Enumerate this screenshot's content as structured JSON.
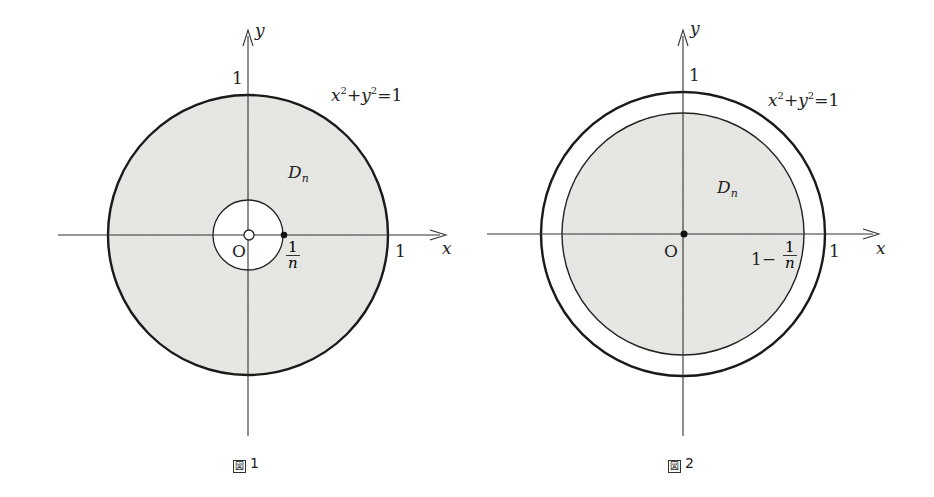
{
  "figures": [
    {
      "caption": "図1",
      "caption_symbol": "図",
      "caption_number": "1",
      "axis_x_label": "x",
      "axis_y_label": "y",
      "origin_label": "O",
      "tick_x": "1",
      "tick_y": "1",
      "circle_equation": {
        "x": "x",
        "x_exp": "2",
        "plus": "+",
        "y": "y",
        "y_exp": "2",
        "eq": "=1"
      },
      "region_label": {
        "main": "D",
        "sub": "n"
      },
      "inner_radius_label": {
        "num": "1",
        "den": "n"
      },
      "description": "Annulus 1/n ≤ r ≤ 1 shaded; origin is an open (excluded) point"
    },
    {
      "caption": "図2",
      "caption_symbol": "図",
      "caption_number": "2",
      "axis_x_label": "x",
      "axis_y_label": "y",
      "origin_label": "O",
      "tick_x": "1",
      "tick_y": "1",
      "circle_equation": {
        "x": "x",
        "x_exp": "2",
        "plus": "+",
        "y": "y",
        "y_exp": "2",
        "eq": "=1"
      },
      "region_label": {
        "main": "D",
        "sub": "n"
      },
      "inner_radius_label": {
        "prefix": "1−",
        "num": "1",
        "den": "n"
      },
      "description": "Disk r ≤ 1 − 1/n shaded inside unit circle; origin is a filled point"
    }
  ],
  "colors": {
    "fill": "#e9e9e6",
    "stroke": "#1a1a1a",
    "axis": "#333333"
  }
}
